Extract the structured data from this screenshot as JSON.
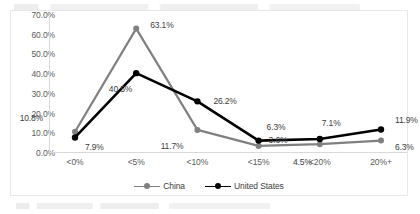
{
  "chart_data": {
    "type": "line",
    "title": "",
    "subtitle": "",
    "xlabel": "",
    "ylabel": "",
    "categories": [
      "<0%",
      "<5%",
      "<10%",
      "<15%",
      "<20%",
      "20%+"
    ],
    "series": [
      {
        "name": "China",
        "color": "#808080",
        "values": [
          10.8,
          63.1,
          11.7,
          3.6,
          4.5,
          6.3
        ],
        "labels": [
          "10.8%",
          "63.1%",
          "11.7%",
          "3.6%",
          "4.5%",
          "6.3%"
        ]
      },
      {
        "name": "United States",
        "color": "#000000",
        "values": [
          7.9,
          40.5,
          26.2,
          6.3,
          7.1,
          11.9
        ],
        "labels": [
          "7.9%",
          "40.5%",
          "26.2%",
          "6.3%",
          "7.1%",
          "11.9%"
        ]
      }
    ],
    "ylim": [
      0,
      70
    ],
    "ytick_labels": [
      "70.0%",
      "60.0%",
      "50.0%",
      "40.0%",
      "30.0%",
      "20.0%",
      "10.0%",
      "0.0%"
    ],
    "ytick_values": [
      70,
      60,
      50,
      40,
      30,
      20,
      10,
      0
    ],
    "grid": false,
    "legend_position": "bottom-center"
  },
  "legend": {
    "items": [
      {
        "label": "China",
        "color": "#808080"
      },
      {
        "label": "United States",
        "color": "#000000"
      }
    ]
  }
}
